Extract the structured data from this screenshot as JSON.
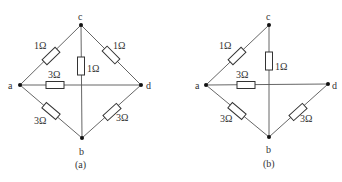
{
  "figure": {
    "panels": [
      {
        "caption": "(a)",
        "nodes": {
          "a": "a",
          "b": "b",
          "c": "c",
          "d": "d"
        },
        "resistors": {
          "ac": "1Ω",
          "cd": "1Ω",
          "cb": "1Ω",
          "ad": "3Ω",
          "ab": "3Ω",
          "bd": "3Ω"
        }
      },
      {
        "caption": "(b)",
        "nodes": {
          "a": "a",
          "b": "b",
          "c": "c",
          "d": "d"
        },
        "resistors": {
          "ac": "1Ω",
          "cb": "1Ω",
          "ad": "3Ω",
          "ab": "3Ω",
          "bd": "3Ω"
        }
      }
    ]
  }
}
